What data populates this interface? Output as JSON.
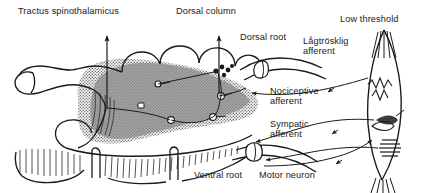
{
  "figure": {
    "width": 423,
    "height": 193,
    "background_color": "#ffffff",
    "ink_color": "#1a1a1a",
    "gray_matter_fill": "#9a9a9a"
  },
  "labels": {
    "tractus_spinothalamicus": "Tractus spinothalamicus",
    "dorsal_column": "Dorsal column",
    "dorsal_root": "Dorsal root",
    "low_threshold": "Low threshold",
    "lagtrosklig_afferent_line1": "Lågtrösklig",
    "lagtrosklig_afferent_line2": "afferent",
    "nociceptive_afferent_line1": "Nociceptive",
    "nociceptive_afferent_line2": "afferent",
    "sympatic_afferent_line1": "Sympatic",
    "sympatic_afferent_line2": "afferent",
    "ventral_root": "Ventral root",
    "motor_neuron": "Motor neuron"
  },
  "structures": {
    "spinal_cord": "spinal-cord-cross-section",
    "gray_matter": "gray-matter-butterfly",
    "dorsal_horn_shading": "dorsal-horn-shaded",
    "central_canal": "central-canal",
    "dorsal_root_ganglion": "dorsal-root-ganglion",
    "ventral_root_bundle": "ventral-root-bundle",
    "muscle_spindle": "muscle-spindle-organ",
    "interneurons": "interneuron-cell-bodies",
    "white_matter_striations": "white-matter-striations"
  },
  "arrows": {
    "tractus_spinothalamicus_arrow": "ascending-arrow-up",
    "dorsal_column_arrow": "ascending-arrow-up",
    "afferent_direction": "toward-cord",
    "efferent_direction": "toward-periphery"
  }
}
